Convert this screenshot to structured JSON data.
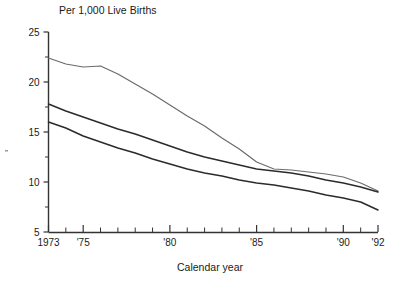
{
  "chart_data": {
    "type": "line",
    "title": "Per 1,000 Live Births",
    "subtitle": "",
    "xlabel": "Calendar year",
    "ylabel": "",
    "xlim": [
      1973,
      1992
    ],
    "ylim": [
      5,
      25
    ],
    "grid": false,
    "legend_position": "inside-right-with-leader-lines",
    "x": [
      1973,
      1974,
      1975,
      1976,
      1977,
      1978,
      1979,
      1980,
      1981,
      1982,
      1983,
      1984,
      1985,
      1986,
      1987,
      1988,
      1989,
      1990,
      1991,
      1992
    ],
    "xticks_major": [
      1973,
      1975,
      1980,
      1985,
      1990,
      1992
    ],
    "xtick_labels": [
      "1973",
      "'75",
      "'80",
      "'85",
      "'90",
      "'92"
    ],
    "yticks_major": [
      5,
      10,
      15,
      20,
      25
    ],
    "ytick_labels": [
      "5",
      "10",
      "15",
      "20",
      "25"
    ],
    "yticks_minor": [
      7.5,
      12.5,
      17.5,
      22.5
    ],
    "series": [
      {
        "name": "Indians & Alaska Natives",
        "color": "#6b6b6b",
        "values": [
          22.4,
          21.8,
          21.5,
          21.6,
          20.8,
          19.8,
          18.8,
          17.7,
          16.6,
          15.6,
          14.4,
          13.3,
          12.0,
          11.3,
          11.2,
          11.0,
          10.8,
          10.5,
          9.9,
          9.1
        ]
      },
      {
        "name": "U.S. All Races",
        "color": "#2b2b2b",
        "values": [
          17.8,
          17.1,
          16.5,
          15.9,
          15.3,
          14.8,
          14.2,
          13.6,
          13.0,
          12.5,
          12.1,
          11.7,
          11.3,
          11.1,
          10.9,
          10.6,
          10.2,
          9.9,
          9.5,
          9.0
        ]
      },
      {
        "name": "U.S. White",
        "color": "#2b2b2b",
        "values": [
          16.0,
          15.4,
          14.6,
          14.0,
          13.4,
          12.9,
          12.3,
          11.8,
          11.3,
          10.9,
          10.6,
          10.2,
          9.9,
          9.7,
          9.4,
          9.1,
          8.7,
          8.4,
          8.0,
          7.2
        ]
      }
    ],
    "annotations": [
      {
        "label": "Indians & Alaska Natives",
        "leader_from_year": 1978.6
      },
      {
        "label": "U.S. All Races",
        "leader_from_year": 1980.3
      },
      {
        "label": "U.S. White",
        "leader_from_year": 1981.6
      }
    ]
  },
  "legend": {
    "items": [
      {
        "label": "Indians & Alaska Natives"
      },
      {
        "label": "U.S. All Races"
      },
      {
        "label": "U.S. White"
      }
    ]
  }
}
